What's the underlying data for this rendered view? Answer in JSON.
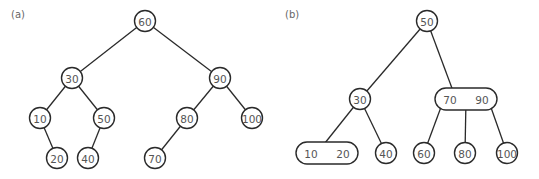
{
  "panels": [
    {
      "label": "(a)",
      "type": "binary-search-tree",
      "nodes": [
        {
          "id": "a60",
          "keys": [
            "60"
          ],
          "cx": 145,
          "cy": 21
        },
        {
          "id": "a30",
          "keys": [
            "30"
          ],
          "cx": 72,
          "cy": 78
        },
        {
          "id": "a90",
          "keys": [
            "90"
          ],
          "cx": 220,
          "cy": 78
        },
        {
          "id": "a10",
          "keys": [
            "10"
          ],
          "cx": 40,
          "cy": 118
        },
        {
          "id": "a50",
          "keys": [
            "50"
          ],
          "cx": 104,
          "cy": 118
        },
        {
          "id": "a80",
          "keys": [
            "80"
          ],
          "cx": 187,
          "cy": 118
        },
        {
          "id": "a100",
          "keys": [
            "100"
          ],
          "cx": 252,
          "cy": 118
        },
        {
          "id": "a20",
          "keys": [
            "20"
          ],
          "cx": 57,
          "cy": 158
        },
        {
          "id": "a40",
          "keys": [
            "40"
          ],
          "cx": 88,
          "cy": 158
        },
        {
          "id": "a70",
          "keys": [
            "70"
          ],
          "cx": 155,
          "cy": 158
        }
      ],
      "edges": [
        [
          "a60",
          "a30"
        ],
        [
          "a60",
          "a90"
        ],
        [
          "a30",
          "a10"
        ],
        [
          "a30",
          "a50"
        ],
        [
          "a10",
          "a20"
        ],
        [
          "a50",
          "a40"
        ],
        [
          "a90",
          "a80"
        ],
        [
          "a90",
          "a100"
        ],
        [
          "a80",
          "a70"
        ]
      ]
    },
    {
      "label": "(b)",
      "type": "2-3-tree",
      "nodes": [
        {
          "id": "b50",
          "keys": [
            "50"
          ],
          "cx": 427,
          "cy": 21
        },
        {
          "id": "b30",
          "keys": [
            "30"
          ],
          "cx": 360,
          "cy": 99
        },
        {
          "id": "b7090",
          "keys": [
            "70",
            "90"
          ],
          "cx": 466,
          "cy": 99
        },
        {
          "id": "b1020",
          "keys": [
            "10",
            "20"
          ],
          "cx": 327,
          "cy": 153
        },
        {
          "id": "b40",
          "keys": [
            "40"
          ],
          "cx": 386,
          "cy": 153
        },
        {
          "id": "b60",
          "keys": [
            "60"
          ],
          "cx": 424,
          "cy": 153
        },
        {
          "id": "b80",
          "keys": [
            "80"
          ],
          "cx": 465,
          "cy": 153
        },
        {
          "id": "b100",
          "keys": [
            "100"
          ],
          "cx": 507,
          "cy": 153
        }
      ],
      "edges": [
        [
          "b50",
          "b30"
        ],
        [
          "b50",
          "b7090"
        ],
        [
          "b30",
          "b1020"
        ],
        [
          "b30",
          "b40"
        ],
        [
          "b7090",
          "b60"
        ],
        [
          "b7090",
          "b80"
        ],
        [
          "b7090",
          "b100"
        ]
      ]
    }
  ]
}
